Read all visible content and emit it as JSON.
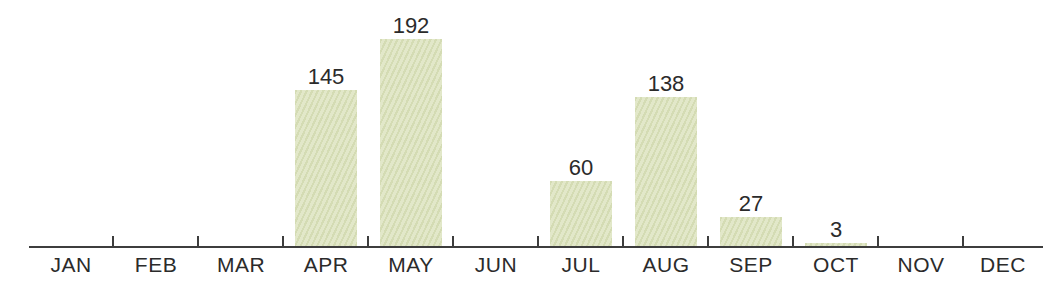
{
  "chart_data": {
    "type": "bar",
    "title": "",
    "xlabel": "",
    "ylabel": "",
    "categories": [
      "JAN",
      "FEB",
      "MAR",
      "APR",
      "MAY",
      "JUN",
      "JUL",
      "AUG",
      "SEP",
      "OCT",
      "NOV",
      "DEC"
    ],
    "values": [
      0,
      0,
      0,
      145,
      192,
      0,
      60,
      138,
      27,
      3,
      0,
      0
    ],
    "value_labels": [
      "",
      "",
      "",
      "145",
      "192",
      "",
      "60",
      "138",
      "27",
      "3",
      "",
      ""
    ],
    "ylim": [
      0,
      230
    ],
    "grid": false,
    "legend": "none",
    "value_labels_shown": true,
    "colors": {
      "bar_fill": "#dfe5c3",
      "axis": "#3d3d3d",
      "text": "#2b2b2b",
      "background": "#ffffff"
    }
  }
}
